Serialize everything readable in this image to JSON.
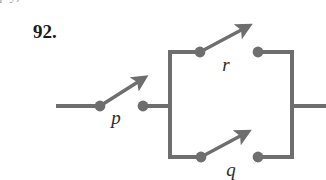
{
  "page": {
    "background_color": "#ffffff",
    "clipped_text_above": "p    y,"
  },
  "exercise": {
    "number_label": "92."
  },
  "diagram": {
    "type": "switching-circuit",
    "line_color": "#6e6e6e",
    "node_color": "#6e6e6e",
    "label_color": "#2b2b2b",
    "line_width": 4,
    "node_radius": 5,
    "switches": [
      {
        "id": "p",
        "label": "p",
        "position": "series-input",
        "left_node": {
          "x": 100,
          "y": 106
        },
        "right_node": {
          "x": 143,
          "y": 106
        },
        "arrow_tip": {
          "x": 143,
          "y": 78
        },
        "label_pos": {
          "x": 116,
          "y": 124
        },
        "state": "open"
      },
      {
        "id": "r",
        "label": "r",
        "position": "parallel-top",
        "left_node": {
          "x": 200,
          "y": 52
        },
        "right_node": {
          "x": 258,
          "y": 52
        },
        "arrow_tip": {
          "x": 247,
          "y": 25
        },
        "label_pos": {
          "x": 221,
          "y": 70
        },
        "state": "open"
      },
      {
        "id": "q",
        "label": "q",
        "position": "parallel-bottom",
        "left_node": {
          "x": 201,
          "y": 157
        },
        "right_node": {
          "x": 258,
          "y": 157
        },
        "arrow_tip": {
          "x": 246,
          "y": 131
        },
        "label_pos": {
          "x": 227,
          "y": 175
        },
        "state": "open"
      }
    ],
    "wires": {
      "input_lead": {
        "x1": 56,
        "y1": 106,
        "x2": 100,
        "y2": 106
      },
      "p_to_junction": {
        "x1": 143,
        "y1": 106,
        "x2": 170,
        "y2": 106
      },
      "left_rail": {
        "x": 170,
        "y_top": 52,
        "y_bottom": 157
      },
      "right_rail": {
        "x": 292,
        "y_top": 52,
        "y_bottom": 157
      },
      "top_rail_left": {
        "x1": 170,
        "y1": 52,
        "x2": 200,
        "y2": 52
      },
      "top_rail_right": {
        "x1": 258,
        "y1": 52,
        "x2": 292,
        "y2": 52
      },
      "bottom_rail_left": {
        "x1": 170,
        "y1": 157,
        "x2": 201,
        "y2": 157
      },
      "bottom_rail_right": {
        "x1": 258,
        "y1": 157,
        "x2": 292,
        "y2": 157
      },
      "output_lead": {
        "x1": 292,
        "y1": 106,
        "x2": 326,
        "y2": 106
      }
    }
  }
}
